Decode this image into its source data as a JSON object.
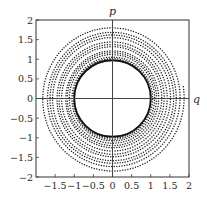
{
  "chart_data": {
    "type": "scatter",
    "title": "",
    "xlabel": "q",
    "ylabel": "p",
    "xlim": [
      -2,
      2
    ],
    "ylim": [
      -2,
      2
    ],
    "grid": false,
    "legend": null,
    "x_ticks": [
      -1.5,
      -1,
      -0.5,
      0,
      0.5,
      1,
      1.5,
      2
    ],
    "x_tick_labels": [
      "−1.5",
      "−1",
      "−0.5",
      "0",
      "0.5",
      "1",
      "1.5",
      "2"
    ],
    "y_ticks": [
      -2,
      -1.5,
      -1,
      -0.5,
      0,
      0.5,
      1,
      1.5,
      2
    ],
    "y_tick_labels": [
      "−2",
      "−1.5",
      "−1",
      "−0.5",
      "0",
      "0.5",
      "1",
      "1.5",
      "2"
    ],
    "axes_through_origin": true,
    "series": [
      {
        "name": "limit-cycle",
        "style": "solid",
        "shape": "circle",
        "center": [
          0,
          0
        ],
        "radius": 1.0,
        "color": "#111111"
      },
      {
        "name": "trajectory",
        "style": "dotted",
        "shape": "inward-spiral-clockwise",
        "start_point": [
          1.85,
          0.3
        ],
        "axis_crossings": [
          {
            "axis": "p",
            "side": "top",
            "value": 1.8
          },
          {
            "axis": "q",
            "side": "left",
            "value": -1.7
          },
          {
            "axis": "p",
            "side": "bottom",
            "value": -1.65
          },
          {
            "axis": "q",
            "side": "right",
            "value": 1.6
          },
          {
            "axis": "p",
            "side": "top",
            "value": 1.55
          },
          {
            "axis": "q",
            "side": "left",
            "value": -1.45
          },
          {
            "axis": "p",
            "side": "bottom",
            "value": -1.42
          },
          {
            "axis": "q",
            "side": "right",
            "value": 1.35
          },
          {
            "axis": "p",
            "side": "top",
            "value": 1.32
          },
          {
            "axis": "q",
            "side": "left",
            "value": -1.22
          },
          {
            "axis": "p",
            "side": "bottom",
            "value": -1.2
          },
          {
            "axis": "q",
            "side": "right",
            "value": 1.15
          },
          {
            "axis": "p",
            "side": "top",
            "value": 1.12
          },
          {
            "axis": "q",
            "side": "left",
            "value": -1.06
          },
          {
            "axis": "p",
            "side": "bottom",
            "value": -1.04
          }
        ],
        "end_radius": 1.0,
        "color": "#222222"
      }
    ]
  },
  "labels": {
    "x_axis": "q",
    "y_axis": "p"
  }
}
